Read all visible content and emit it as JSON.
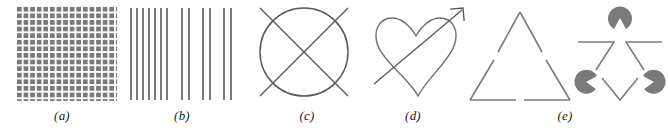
{
  "figure": {
    "width": 668,
    "height": 130,
    "background": "#ffffff",
    "ink_color": "#6f6f6f",
    "stroke_dark": "#5a5a5a",
    "texture_color": "#7a7a7a",
    "label_color": "#1a1a1a",
    "panel_count": 5
  },
  "panels": [
    {
      "id": "a",
      "label": "(a)",
      "name": "texture-grid-panel",
      "kind": "texture",
      "description": "dense grid of gray blocks separated by white cross-shaped gaps",
      "label_x": 62,
      "panel_x": 0,
      "panel_width": 130,
      "texture": {
        "x": 17,
        "y": 5,
        "width": 100,
        "height": 96,
        "cell": 6.6,
        "gap": 2.0,
        "color": "#7a7a7a"
      }
    },
    {
      "id": "b",
      "label": "(b)",
      "name": "vertical-lines-panel",
      "kind": "lines",
      "description": "vertical line grating with grouped spacing",
      "label_x": 182,
      "panel_x": 126,
      "panel_width": 112,
      "lines": {
        "y_top": 8,
        "y_bottom": 100,
        "width": 2,
        "color": "#7a7a7a",
        "x_positions": [
          131,
          137,
          143,
          149,
          155,
          161,
          167,
          182,
          189,
          203,
          210,
          224,
          231
        ]
      }
    },
    {
      "id": "c",
      "label": "(c)",
      "name": "circle-with-cross-panel",
      "kind": "circle-x",
      "description": "circle overlaid by a large X whose arms extend past the rim",
      "label_x": 307,
      "panel_x": 248,
      "panel_width": 120,
      "circle": {
        "cx": 56,
        "cy": 52,
        "r": 44
      },
      "cross": {
        "half_length": 62
      }
    },
    {
      "id": "d",
      "label": "(d)",
      "name": "heart-with-arrow-panel",
      "kind": "heart-arrow",
      "description": "outline heart pierced by a diagonal arrow pointing up-right",
      "label_x": 413,
      "panel_x": 370,
      "panel_width": 115,
      "arrow": {
        "x1": 10,
        "y1": 86,
        "x2": 86,
        "y2": 12,
        "head": 11
      }
    },
    {
      "id": "e",
      "label": "(e)",
      "name": "illusory-triangle-panel",
      "kind": "illusory",
      "description": "gapped outline triangle beside a Kanizsa-style figure of three pac-man discs with corner angles",
      "label_x": 565,
      "panel_x": 462,
      "panel_width": 206,
      "triangle": {
        "apex_x": 58,
        "apex_y": 12,
        "left_x": 8,
        "left_y": 100,
        "right_x": 108,
        "right_y": 100,
        "gaps": 2
      },
      "kanizsa": {
        "offset_x": 110,
        "disc_radius": 12,
        "disc_color": "#7a7a7a",
        "discs": [
          {
            "cx": 58,
            "cy": 18,
            "notch_deg": 90
          },
          {
            "cx": 18,
            "cy": 88,
            "notch_deg": 330
          },
          {
            "cx": 98,
            "cy": 88,
            "notch_deg": 210
          }
        ]
      }
    }
  ]
}
